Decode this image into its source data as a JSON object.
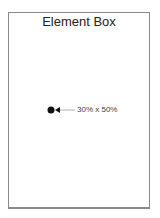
{
  "diagram": {
    "title": "Element Box",
    "marker": {
      "x_fraction": 0.3,
      "y_fraction": 0.5
    },
    "readout_label": "30% x 50%",
    "colors": {
      "border": "#8a8a8a",
      "marker": "#111111",
      "pointer": "#b0b0b0",
      "text": "#444444"
    }
  }
}
